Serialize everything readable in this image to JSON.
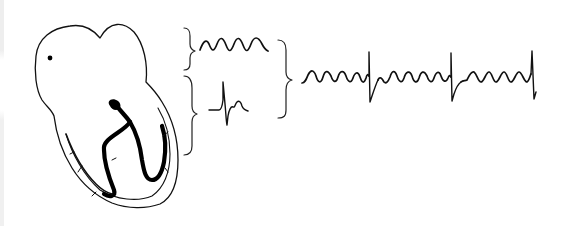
{
  "figure": {
    "type": "medical-illustration",
    "components": [
      {
        "id": "heart",
        "label": "",
        "description": "Heart outline with sinoatrial node dot and bundle branches"
      },
      {
        "id": "sa-node",
        "label": "",
        "description": "Small black dot in right atrium"
      },
      {
        "id": "bundle-branches",
        "label": "",
        "description": "Thick black His bundle dividing into left and right branches"
      },
      {
        "id": "atrial-brace",
        "label": "",
        "description": "Upper brace grouping atrial region"
      },
      {
        "id": "atrial-waveform",
        "label": "",
        "description": "Fibrillatory f-wave tracing (atrial activity)"
      },
      {
        "id": "ventricular-brace",
        "label": "",
        "description": "Lower brace grouping ventricular region"
      },
      {
        "id": "ventricular-waveform",
        "label": "",
        "description": "Single QRS-T complex (ventricular activity)"
      },
      {
        "id": "combine-brace",
        "label": "",
        "description": "Brace combining atrial and ventricular activity"
      },
      {
        "id": "combined-ecg-strip",
        "label": "",
        "description": "Resulting ECG: continuous fibrillatory waves with irregular QRS spikes"
      }
    ],
    "ecg_strip": {
      "qrs_count": 3,
      "fwave_description": "continuous undulating baseline"
    },
    "colors": {
      "background": "#ffffff",
      "stroke": "#111111"
    }
  }
}
